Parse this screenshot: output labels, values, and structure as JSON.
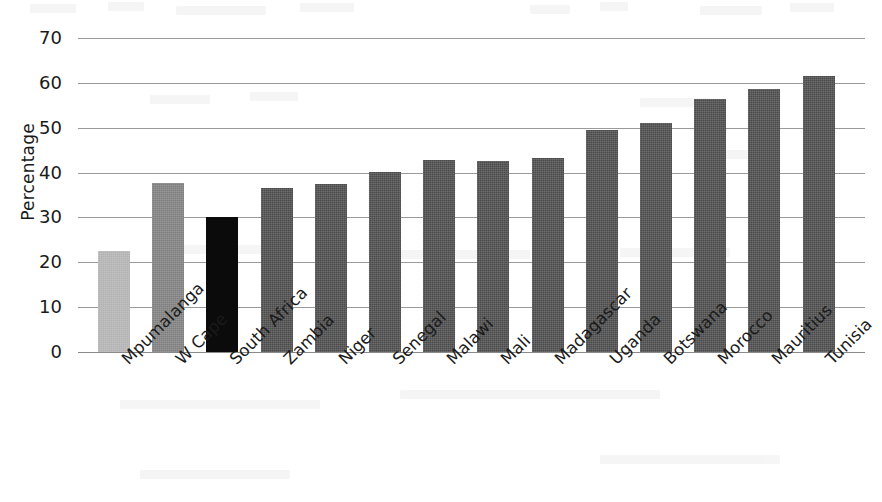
{
  "chart_data": {
    "type": "bar",
    "title": "",
    "subtitle": "",
    "xlabel": "",
    "ylabel": "Percentage",
    "ylim": [
      0,
      70
    ],
    "ytick_values": [
      70,
      60,
      50,
      40,
      30,
      20,
      10,
      0
    ],
    "ytick_labels": [
      "70",
      "60",
      "50",
      "40",
      "30",
      "20",
      "10",
      "0"
    ],
    "grid": "horizontal",
    "legend": "none",
    "orientation": "vertical",
    "categories": [
      "Mpumalanga",
      "W Cape",
      "South Africa",
      "Zambia",
      "Niger",
      "Senegal",
      "Malawi",
      "Mali",
      "Madagascar",
      "Uganda",
      "Botswana",
      "Morocco",
      "Mauritius",
      "Tunisia"
    ],
    "values": [
      22.5,
      37.7,
      30.0,
      36.5,
      37.4,
      40.1,
      42.9,
      42.6,
      43.3,
      49.4,
      51.1,
      56.5,
      58.6,
      61.5
    ],
    "bar_styles": [
      "light",
      "mid",
      "dark",
      "standard",
      "standard",
      "standard",
      "standard",
      "standard",
      "standard",
      "standard",
      "standard",
      "standard",
      "standard",
      "standard"
    ],
    "colors": {
      "standard_bar": "#4a4a4a",
      "light_bar": "#b2b2b2",
      "mid_bar": "#7e7e7e",
      "dark_bar": "#0b0b0b",
      "gridline": "#9a9a9a",
      "text": "#1a1a1a",
      "background": "#ffffff"
    }
  }
}
